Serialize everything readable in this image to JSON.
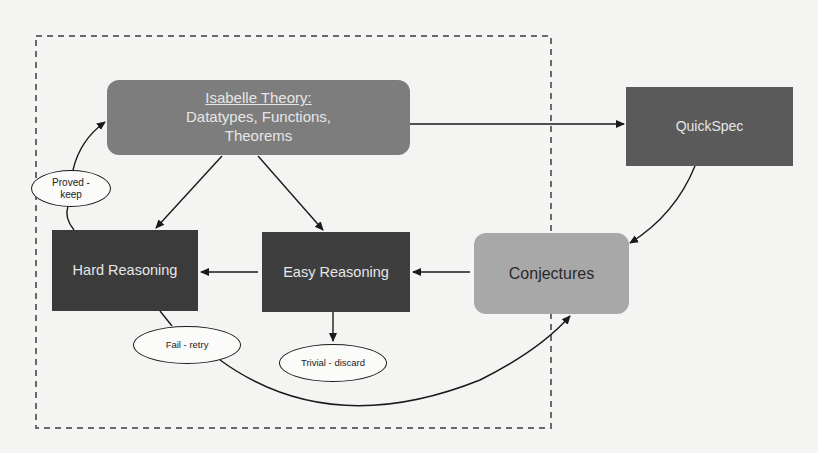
{
  "diagram": {
    "nodes": {
      "isabelle": {
        "title": "Isabelle Theory:",
        "subtitle_line1": "Datatypes, Functions,",
        "subtitle_line2": "Theorems",
        "color": "#7d7d7d"
      },
      "quickspec": {
        "label": "QuickSpec",
        "color": "#5a5a5a"
      },
      "conjectures": {
        "label": "Conjectures",
        "color": "#a8a8a8",
        "text_color": "#2a2a2a"
      },
      "hard_reasoning": {
        "label": "Hard Reasoning",
        "color": "#3b3b3b"
      },
      "easy_reasoning": {
        "label": "Easy Reasoning",
        "color": "#3e3e3e"
      }
    },
    "outcomes": {
      "proved": {
        "line1": "Proved -",
        "line2": "keep"
      },
      "fail": {
        "label": "Fail - retry"
      },
      "trivial": {
        "label": "Trivial - discard"
      }
    },
    "edges": [
      {
        "from": "isabelle",
        "to": "quickspec"
      },
      {
        "from": "quickspec",
        "to": "conjectures"
      },
      {
        "from": "conjectures",
        "to": "easy_reasoning"
      },
      {
        "from": "easy_reasoning",
        "to": "hard_reasoning"
      },
      {
        "from": "isabelle",
        "to": "hard_reasoning"
      },
      {
        "from": "isabelle",
        "to": "easy_reasoning"
      },
      {
        "from": "easy_reasoning",
        "to": "trivial"
      },
      {
        "from": "hard_reasoning",
        "to": "proved",
        "then": "isabelle"
      },
      {
        "from": "hard_reasoning",
        "to": "fail",
        "then": "conjectures"
      }
    ]
  }
}
